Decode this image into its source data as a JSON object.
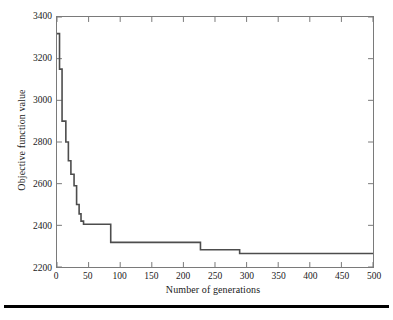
{
  "chart_data": {
    "type": "line",
    "title": "",
    "xlabel": "Number of generations",
    "ylabel": "Objective function value",
    "xlim": [
      0,
      500
    ],
    "ylim": [
      2200,
      3400
    ],
    "xticks": [
      0,
      50,
      100,
      150,
      200,
      250,
      300,
      350,
      400,
      450,
      500
    ],
    "yticks": [
      2200,
      2400,
      2600,
      2800,
      3000,
      3200,
      3400
    ],
    "grid": false,
    "legend": null,
    "line_color": "#4d4d4d",
    "series": [
      {
        "name": "Best objective function value",
        "step": "post",
        "x": [
          0,
          4,
          4,
          8,
          8,
          14,
          14,
          18,
          18,
          22,
          22,
          27,
          27,
          31,
          31,
          35,
          35,
          38,
          38,
          42,
          42,
          85,
          85,
          227,
          227,
          289,
          289,
          500
        ],
        "values": [
          3320,
          3320,
          3150,
          3150,
          2900,
          2900,
          2800,
          2800,
          2710,
          2710,
          2645,
          2645,
          2590,
          2590,
          2500,
          2500,
          2455,
          2455,
          2420,
          2420,
          2405,
          2405,
          2318,
          2318,
          2283,
          2283,
          2265,
          2265
        ]
      }
    ],
    "annotations": []
  },
  "axes": {
    "y_tick_labels": [
      "3400",
      "3200",
      "3000",
      "2800",
      "2600",
      "2400",
      "2200"
    ],
    "x_tick_labels": [
      "0",
      "50",
      "100",
      "150",
      "200",
      "250",
      "300",
      "350",
      "400",
      "450",
      "500"
    ],
    "x_title": "Number of generations",
    "y_title": "Objective function value"
  }
}
